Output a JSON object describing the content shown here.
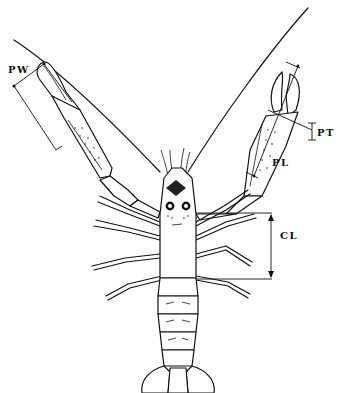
{
  "diagram": {
    "labels": {
      "pw": "PW",
      "pt": "PT",
      "pl": "PL",
      "cl": "CL"
    },
    "measurements": [
      {
        "code": "PW",
        "meaning": "propodus width",
        "position": "upper-left claw"
      },
      {
        "code": "PT",
        "meaning": "propodus thickness",
        "position": "right of right claw"
      },
      {
        "code": "PL",
        "meaning": "propodus length",
        "position": "along right claw"
      },
      {
        "code": "CL",
        "meaning": "carapace length",
        "position": "right of carapace"
      }
    ],
    "colors": {
      "ink": "#111111",
      "background": "#ffffff"
    }
  }
}
